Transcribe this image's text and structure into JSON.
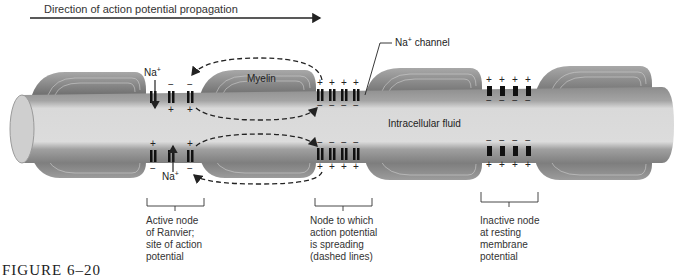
{
  "header": {
    "title": "Direction of action potential propagation"
  },
  "labels": {
    "na_top": "Na",
    "na_bottom": "Na",
    "na_sup": "+",
    "myelin": "Myelin",
    "na_channel": "channel",
    "na_channel_prefix": "Na",
    "intracellular": "Intracellular fluid"
  },
  "captions": [
    {
      "lines": [
        "Active node",
        "of Ranvier;",
        "site of action",
        "potential"
      ]
    },
    {
      "lines": [
        "Node to which",
        "action potential",
        "is spreading",
        "(dashed lines)"
      ]
    },
    {
      "lines": [
        "Inactive node",
        "at resting",
        "membrane",
        "potential"
      ]
    }
  ],
  "figure_caption": "FIGURE 6–20",
  "colors": {
    "myelin": "#8a8a8a",
    "axon_outer": "#9a9a9a",
    "axon_core": "#d6d6d6",
    "channel": "#111111"
  }
}
